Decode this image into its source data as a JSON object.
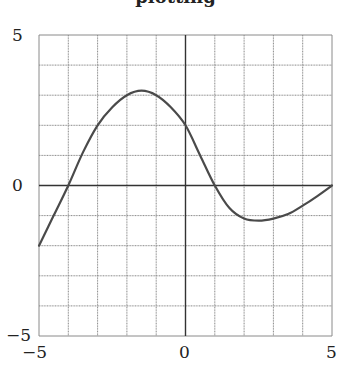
{
  "chart_data": {
    "type": "line",
    "title": "plotting",
    "xlabel": "",
    "ylabel": "",
    "xlim": [
      -5,
      5
    ],
    "ylim": [
      -5,
      5
    ],
    "grid": true,
    "x_ticks": [
      "-5",
      "0",
      "5"
    ],
    "y_ticks": [
      "5",
      "0",
      "-5"
    ],
    "series": [
      {
        "name": "f(x)",
        "color": "#4a4a4a",
        "x": [
          -5,
          -4.5,
          -4,
          -3.5,
          -3,
          -2.5,
          -2,
          -1.5,
          -1,
          -0.5,
          0,
          0.5,
          1,
          1.5,
          2,
          2.5,
          3,
          3.5,
          4,
          4.5,
          5
        ],
        "y": [
          -2.0,
          -1.0,
          0.0,
          1.1,
          2.0,
          2.6,
          3.0,
          3.15,
          3.0,
          2.6,
          2.0,
          1.0,
          0.0,
          -0.75,
          -1.1,
          -1.17,
          -1.1,
          -0.95,
          -0.67,
          -0.35,
          0.0
        ]
      }
    ]
  },
  "labels": {
    "title": "plotting",
    "y_top": "5",
    "y_mid": "0",
    "y_bottom": "−5",
    "x_left": "−5",
    "x_mid": "0",
    "x_right": "5"
  }
}
